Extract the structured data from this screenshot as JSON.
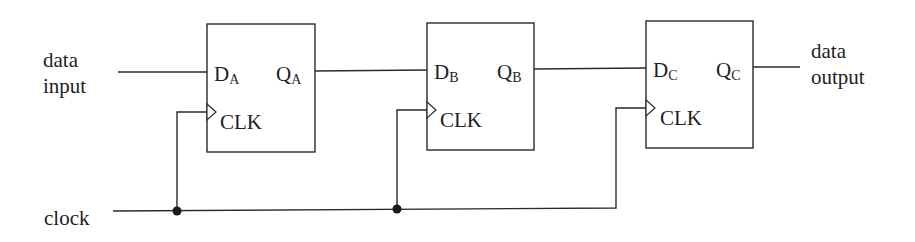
{
  "labels": {
    "data_input_line1": "data",
    "data_input_line2": "input",
    "data_output_line1": "data",
    "data_output_line2": "output",
    "clock": "clock"
  },
  "flipflops": [
    {
      "id": "A",
      "d_label": "D",
      "d_sub": "A",
      "q_label": "Q",
      "q_sub": "A",
      "clk_label": "CLK"
    },
    {
      "id": "B",
      "d_label": "D",
      "d_sub": "B",
      "q_label": "Q",
      "q_sub": "B",
      "clk_label": "CLK"
    },
    {
      "id": "C",
      "d_label": "D",
      "d_sub": "C",
      "q_label": "Q",
      "q_sub": "C",
      "clk_label": "CLK"
    }
  ],
  "colors": {
    "line": "#2a2a2a",
    "background": "#ffffff"
  }
}
